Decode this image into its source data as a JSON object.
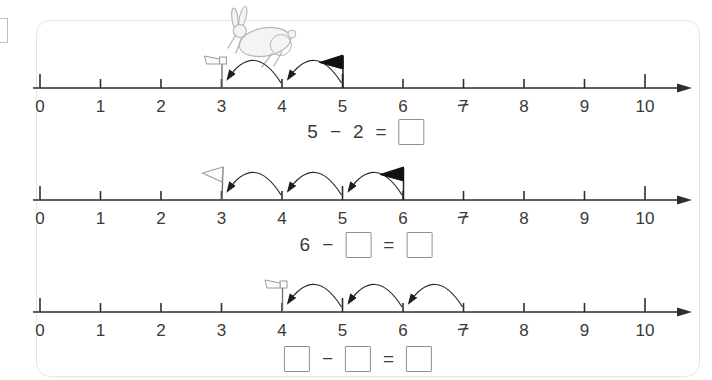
{
  "worksheet": {
    "tick_labels": [
      "0",
      "1",
      "2",
      "3",
      "4",
      "5",
      "6",
      "7",
      "8",
      "9",
      "10"
    ],
    "geometry": {
      "x0": 40,
      "unit": 60.5,
      "axis_start_x": 33,
      "axis_end_x": 679,
      "arrow_tip_x": 692
    },
    "colors": {
      "axis": "#2e2e2e",
      "label": "#3a3a3a",
      "arc": "#2b2b2b",
      "box_border": "#8f8f8f",
      "black_flag": "#111111",
      "white_flag_fill": "#fdfdfd",
      "white_flag_stroke": "#9a9a9a",
      "card_border": "#e4e4e4",
      "rabbit_stroke": "#b6b6b6",
      "rabbit_fill": "#f4f4f4"
    },
    "number_lines": [
      {
        "axis_y": 88,
        "start_flag": {
          "type": "white-small",
          "position": 3
        },
        "end_flag": {
          "type": "black",
          "position": 5
        },
        "hops": [
          [
            5,
            4
          ],
          [
            4,
            3
          ]
        ],
        "rabbit_position": 3.7,
        "equation_center_x": 366,
        "equation_top": 119,
        "equation": [
          {
            "type": "number",
            "value": "5"
          },
          {
            "type": "operator",
            "value": "−"
          },
          {
            "type": "number",
            "value": "2"
          },
          {
            "type": "operator",
            "value": "="
          },
          {
            "type": "answer-box",
            "value": ""
          }
        ]
      },
      {
        "axis_y": 200,
        "start_flag": {
          "type": "white-large",
          "position": 3
        },
        "end_flag": {
          "type": "black",
          "position": 6
        },
        "hops": [
          [
            6,
            5
          ],
          [
            5,
            4
          ],
          [
            4,
            3
          ]
        ],
        "rabbit_position": null,
        "equation_center_x": 366,
        "equation_top": 232,
        "equation": [
          {
            "type": "number",
            "value": "6"
          },
          {
            "type": "operator",
            "value": "−"
          },
          {
            "type": "answer-box",
            "value": ""
          },
          {
            "type": "operator",
            "value": "="
          },
          {
            "type": "answer-box",
            "value": ""
          }
        ]
      },
      {
        "axis_y": 312,
        "start_flag": {
          "type": "white-small",
          "position": 4
        },
        "end_flag": null,
        "hops": [
          [
            7,
            6
          ],
          [
            6,
            5
          ],
          [
            5,
            4
          ]
        ],
        "rabbit_position": null,
        "equation_center_x": 358,
        "equation_top": 346,
        "equation": [
          {
            "type": "answer-box",
            "value": ""
          },
          {
            "type": "operator",
            "value": "−"
          },
          {
            "type": "answer-box",
            "value": ""
          },
          {
            "type": "operator",
            "value": "="
          },
          {
            "type": "answer-box",
            "value": ""
          }
        ]
      }
    ]
  }
}
